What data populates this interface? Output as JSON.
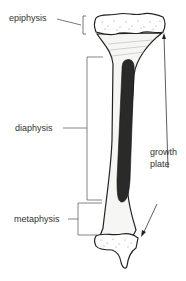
{
  "diagram": {
    "labels": {
      "epiphysis": "epiphysis",
      "diaphysis": "diaphysis",
      "metaphysis": "metaphysis",
      "growth_plate_line1": "growth",
      "growth_plate_line2": "plate"
    },
    "colors": {
      "outline": "#222222",
      "marrow": "#2a2a2a",
      "leader": "#555555",
      "text": "#333333"
    }
  }
}
